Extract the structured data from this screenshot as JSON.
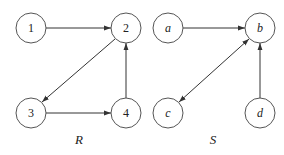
{
  "graphs": [
    {
      "caption": "R",
      "nodes": [
        {
          "id": "1",
          "label": "1",
          "x": 31,
          "y": 28
        },
        {
          "id": "2",
          "label": "2",
          "x": 126,
          "y": 28
        },
        {
          "id": "3",
          "label": "3",
          "x": 31,
          "y": 113
        },
        {
          "id": "4",
          "label": "4",
          "x": 126,
          "y": 113
        }
      ],
      "edges": [
        {
          "from": "1",
          "to": "2",
          "directed": true
        },
        {
          "from": "2",
          "to": "3",
          "directed": true
        },
        {
          "from": "3",
          "to": "4",
          "directed": true
        },
        {
          "from": "4",
          "to": "2",
          "directed": true
        }
      ]
    },
    {
      "caption": "S",
      "nodes": [
        {
          "id": "a",
          "label": "a",
          "x": 168,
          "y": 28
        },
        {
          "id": "b",
          "label": "b",
          "x": 260,
          "y": 28
        },
        {
          "id": "c",
          "label": "c",
          "x": 168,
          "y": 113
        },
        {
          "id": "d",
          "label": "d",
          "x": 260,
          "y": 113
        }
      ],
      "edges": [
        {
          "from": "a",
          "to": "b",
          "directed": true
        },
        {
          "from": "c",
          "to": "b",
          "directed": true,
          "bidirectional": true
        },
        {
          "from": "d",
          "to": "b",
          "directed": true
        }
      ]
    }
  ],
  "colors": {
    "node_stroke": "#555555",
    "edge_stroke": "#333333",
    "background": "#ffffff"
  }
}
